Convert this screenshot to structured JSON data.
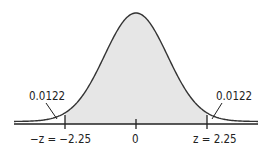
{
  "diagram": {
    "type": "normal-distribution",
    "mean": 0,
    "z_critical": 2.25,
    "tail_area": 0.0122,
    "labels": {
      "left_tail_area": "0.0122",
      "right_tail_area": "0.0122",
      "left_tick": "−z = −2.25",
      "center_tick": "0",
      "right_tick": "z = 2.25"
    },
    "colors": {
      "curve": "#333333",
      "shade": "#e6e6e6",
      "axis": "#222222"
    }
  }
}
